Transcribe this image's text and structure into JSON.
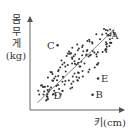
{
  "chart_data": {
    "type": "scatter",
    "title": "",
    "xlabel": "키(cm)",
    "ylabel": "몸무게 (kg)",
    "ylabel_lines": [
      "몸",
      "무",
      "게",
      "(kg)"
    ],
    "grid": false,
    "legend": null,
    "axis": {
      "x_ticks": [],
      "y_ticks": []
    },
    "trend_line": {
      "from": [
        0.08,
        0.08
      ],
      "to": [
        0.92,
        0.9
      ]
    },
    "labeled_points": [
      {
        "label": "A",
        "x": 0.85,
        "y": 0.83,
        "label_side": "right"
      },
      {
        "label": "B",
        "x": 0.68,
        "y": 0.17,
        "label_side": "right"
      },
      {
        "label": "C",
        "x": 0.3,
        "y": 0.72,
        "label_side": "left"
      },
      {
        "label": "D",
        "x": 0.3,
        "y": 0.16,
        "label_side": "center"
      },
      {
        "label": "E",
        "x": 0.74,
        "y": 0.35,
        "label_side": "right"
      }
    ],
    "cluster": {
      "description": "dense elliptical cloud of points along positive-correlation trend line",
      "approx_point_count": 150,
      "center": [
        0.5,
        0.5
      ],
      "major_axis_angle_deg": 44,
      "major_radius": 0.56,
      "minor_radius": 0.17
    },
    "colors": {
      "points": "#333333",
      "axis": "#555555",
      "trend_line": "#666666",
      "text": "#333333"
    }
  }
}
